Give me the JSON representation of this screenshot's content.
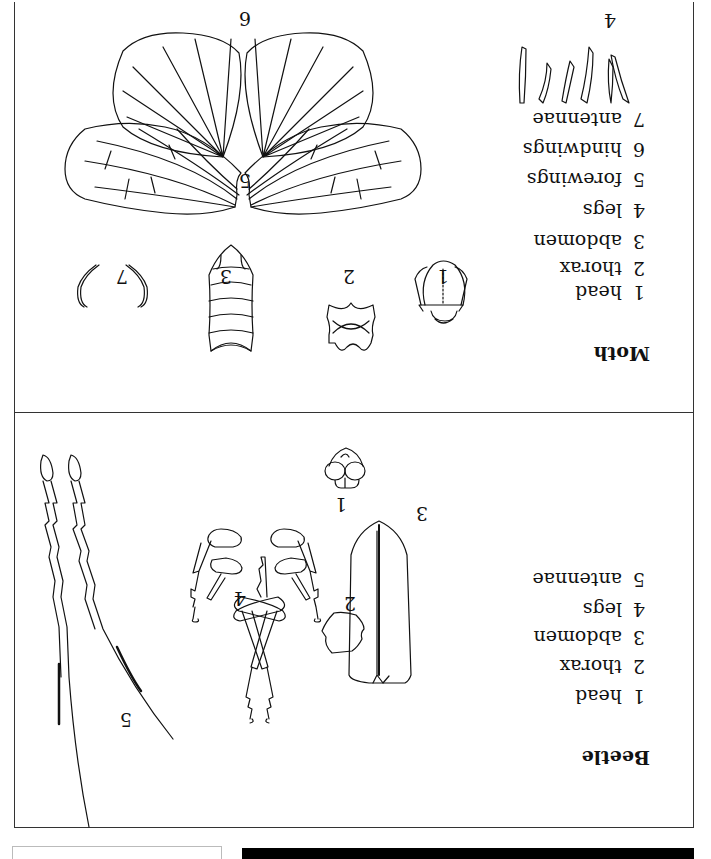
{
  "orientation": "rotated 180 degrees",
  "beetle": {
    "title": "Beetle",
    "legend": [
      {
        "num": "1",
        "label": "head"
      },
      {
        "num": "2",
        "label": "thorax"
      },
      {
        "num": "3",
        "label": "abdomen"
      },
      {
        "num": "4",
        "label": "legs"
      },
      {
        "num": "5",
        "label": "antennae"
      }
    ],
    "part_labels": {
      "head": "1",
      "thorax": "2",
      "abdomen": "3",
      "legs": "4",
      "antennae": "5"
    }
  },
  "moth": {
    "title": "Moth",
    "legend": [
      {
        "num": "1",
        "label": "head"
      },
      {
        "num": "2",
        "label": "thorax"
      },
      {
        "num": "3",
        "label": "abdomen"
      },
      {
        "num": "4",
        "label": "legs"
      },
      {
        "num": "5",
        "label": "forewings"
      },
      {
        "num": "6",
        "label": "hindwings"
      },
      {
        "num": "7",
        "label": "antennae"
      }
    ],
    "part_labels": {
      "head": "1",
      "thorax": "2",
      "abdomen": "3",
      "legs": "4",
      "forewings": "5",
      "hindwings": "6",
      "antennae": "7"
    }
  }
}
